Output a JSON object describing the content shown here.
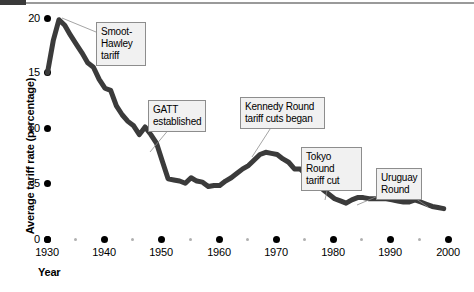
{
  "chart_data": {
    "type": "line",
    "title": "",
    "xlabel": "Year",
    "ylabel": "Average tariff rate (percentage)",
    "xlim": [
      1930,
      2000
    ],
    "ylim": [
      0,
      20
    ],
    "grid": false,
    "legend": "none",
    "x_ticks": [
      "1930",
      "1940",
      "1950",
      "1960",
      "1970",
      "1980",
      "1990",
      "2000"
    ],
    "x_minor_ticks": [
      "1935",
      "1945",
      "1955",
      "1965",
      "1975",
      "1985",
      "1995"
    ],
    "y_ticks": [
      "0",
      "5",
      "10",
      "15",
      "20"
    ],
    "series": [
      {
        "name": "Average tariff rate",
        "color": "#3b3b3b",
        "x": [
          1930,
          1931,
          1932,
          1933,
          1934,
          1935,
          1936,
          1937,
          1938,
          1939,
          1940,
          1941,
          1942,
          1943,
          1944,
          1945,
          1946,
          1947,
          1948,
          1949,
          1950,
          1951,
          1952,
          1953,
          1954,
          1955,
          1956,
          1957,
          1958,
          1959,
          1960,
          1961,
          1962,
          1963,
          1964,
          1965,
          1966,
          1967,
          1968,
          1969,
          1970,
          1971,
          1972,
          1973,
          1974,
          1975,
          1976,
          1977,
          1978,
          1979,
          1980,
          1981,
          1982,
          1983,
          1984,
          1985,
          1986,
          1987,
          1988,
          1989,
          1990,
          1991,
          1992,
          1993,
          1994,
          1995,
          1996,
          1997,
          1998,
          1999
        ],
        "y": [
          15.0,
          17.9,
          19.8,
          19.3,
          18.4,
          17.6,
          16.8,
          15.9,
          15.5,
          14.4,
          13.6,
          13.4,
          12.0,
          11.2,
          10.6,
          10.2,
          9.4,
          10.1,
          9.4,
          8.6,
          7.0,
          5.4,
          5.3,
          5.2,
          5.0,
          5.5,
          5.2,
          5.1,
          4.7,
          4.8,
          4.8,
          5.2,
          5.5,
          5.9,
          6.3,
          6.6,
          7.1,
          7.6,
          7.8,
          7.7,
          7.6,
          7.2,
          6.9,
          6.3,
          6.3,
          5.8,
          5.5,
          5.1,
          4.4,
          4.0,
          3.6,
          3.4,
          3.2,
          3.5,
          3.7,
          3.7,
          3.6,
          3.6,
          3.6,
          3.6,
          3.5,
          3.4,
          3.3,
          3.3,
          3.5,
          3.3,
          3.1,
          2.9,
          2.8,
          2.7
        ]
      }
    ],
    "annotations": [
      {
        "id": "smoot-hawley",
        "label": "Smoot-\nHawley\ntariff",
        "target_x": 1932,
        "target_y": 19.8
      },
      {
        "id": "gatt",
        "label": "GATT\nestablished",
        "target_x": 1947,
        "target_y": 10.1
      },
      {
        "id": "kennedy-round",
        "label": "Kennedy Round\ntariff cuts began",
        "target_x": 1968,
        "target_y": 7.8
      },
      {
        "id": "tokyo-round",
        "label": "Tokyo Round\ntariff cut",
        "target_x": 1979,
        "target_y": 4.0
      },
      {
        "id": "uruguay-round",
        "label": "Uruguay\nRound",
        "target_x": 1994,
        "target_y": 3.5
      }
    ]
  },
  "axes": {
    "y_label": "Average tariff rate (percentage)",
    "x_label": "Year",
    "y_ticks": [
      "20",
      "15",
      "10",
      "5",
      "0"
    ],
    "x_ticks": [
      "1930",
      "1940",
      "1950",
      "1960",
      "1970",
      "1980",
      "1990",
      "2000"
    ]
  },
  "callouts": {
    "smoot_hawley": "Smoot-\nHawley\ntariff",
    "gatt": "GATT\nestablished",
    "kennedy": "Kennedy Round\ntariff cuts began",
    "tokyo": "Tokyo Round\ntariff cut",
    "uruguay": "Uruguay\nRound"
  }
}
